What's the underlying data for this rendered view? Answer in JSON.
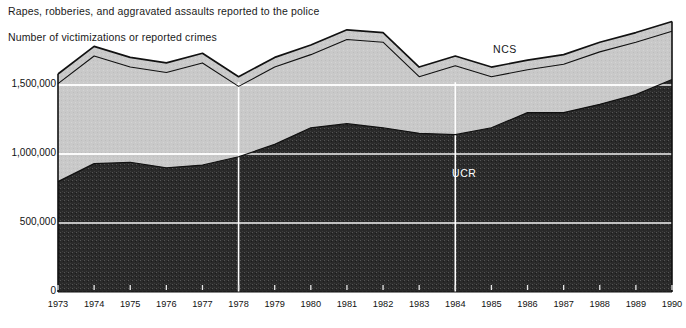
{
  "titles": {
    "main": "Rapes, robberies, and aggravated assaults reported to the police",
    "sub": "Number of victimizations or reported crimes"
  },
  "source_note": "",
  "colors": {
    "ncs_fill": "#c9c9c9",
    "ucr_fill": "#2a2a2a",
    "outline": "#111111",
    "gridline": "#ffffff",
    "axis": "#111111",
    "text": "#1a1a1a",
    "ucr_label": "#ffffff"
  },
  "chart_data": {
    "type": "area",
    "title": "Rapes, robberies, and aggravated assaults reported to the police",
    "subtitle": "Number of victimizations or reported crimes",
    "xlabel": "",
    "ylabel": "Number of victimizations or reported crimes",
    "categories": [
      1973,
      1974,
      1975,
      1976,
      1977,
      1978,
      1979,
      1980,
      1981,
      1982,
      1983,
      1984,
      1985,
      1986,
      1987,
      1988,
      1989,
      1990
    ],
    "ylim": [
      0,
      2000000
    ],
    "yticks": [
      0,
      500000,
      1000000,
      1500000
    ],
    "ytick_labels": [
      "0",
      "500,000",
      "1,000,000",
      "1,500,000"
    ],
    "xtick_labels": [
      "1973",
      "1974",
      "1975",
      "1976",
      "1977",
      "1978",
      "1979",
      "1980",
      "1981",
      "1982",
      "1983",
      "1984",
      "1985",
      "1986",
      "1987",
      "1988",
      "1989",
      "1990"
    ],
    "grid": true,
    "gridlines_vertical_at": [
      1978,
      1984
    ],
    "legend": "inline-annotations",
    "stacking": "overlaid-totals",
    "series": [
      {
        "name": "NCS",
        "label_position": {
          "x": 493,
          "y": 43
        },
        "values": [
          1580000,
          1780000,
          1700000,
          1660000,
          1730000,
          1560000,
          1700000,
          1790000,
          1900000,
          1880000,
          1630000,
          1710000,
          1630000,
          1680000,
          1720000,
          1810000,
          1880000,
          1960000
        ]
      },
      {
        "name": "UCR",
        "label_position": {
          "x": 452,
          "y": 167
        },
        "values": [
          800000,
          930000,
          940000,
          900000,
          920000,
          980000,
          1070000,
          1190000,
          1220000,
          1190000,
          1150000,
          1140000,
          1190000,
          1300000,
          1300000,
          1360000,
          1430000,
          1540000
        ]
      }
    ]
  }
}
